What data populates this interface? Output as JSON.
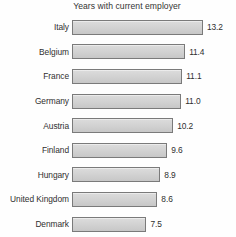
{
  "chart_data": {
    "type": "bar",
    "orientation": "horizontal",
    "title": "Years with current employer",
    "xlabel": "",
    "ylabel": "",
    "grid": false,
    "legend": null,
    "xlim": [
      0,
      13.2
    ],
    "categories": [
      "Italy",
      "Belgium",
      "France",
      "Germany",
      "Austria",
      "Finland",
      "Hungary",
      "United Kingdom",
      "Denmark"
    ],
    "values": [
      13.2,
      11.4,
      11.1,
      11.0,
      10.2,
      9.6,
      8.9,
      8.6,
      7.5
    ],
    "value_labels": [
      "13.2",
      "11.4",
      "11.1",
      "11.0",
      "10.2",
      "9.6",
      "8.9",
      "8.6",
      "7.5"
    ],
    "bar_fill_color": "#d4d4d4",
    "bar_border_color": "#7a7a7a",
    "background_color": "#fefefe",
    "text_color": "#2f2f2f"
  }
}
